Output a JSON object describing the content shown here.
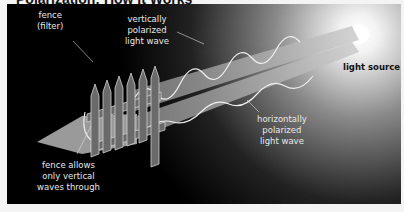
{
  "title": "Polarization: How It Works",
  "labels": {
    "fence": [
      "fence",
      "(filter)"
    ],
    "vertical_wave": [
      "vertically",
      "polarized",
      "light wave"
    ],
    "light_source": "light source",
    "horizontal_wave": [
      "horizontally",
      "polarized",
      "light wave"
    ],
    "fence_allows": [
      "fence allows",
      "only vertical",
      "waves through"
    ]
  },
  "colors": {
    "background": "#000000",
    "beam": "#a8a8a8",
    "wave": "#f0f0f0",
    "fence": "#6a6a6a",
    "light_source": "#ffffff"
  }
}
